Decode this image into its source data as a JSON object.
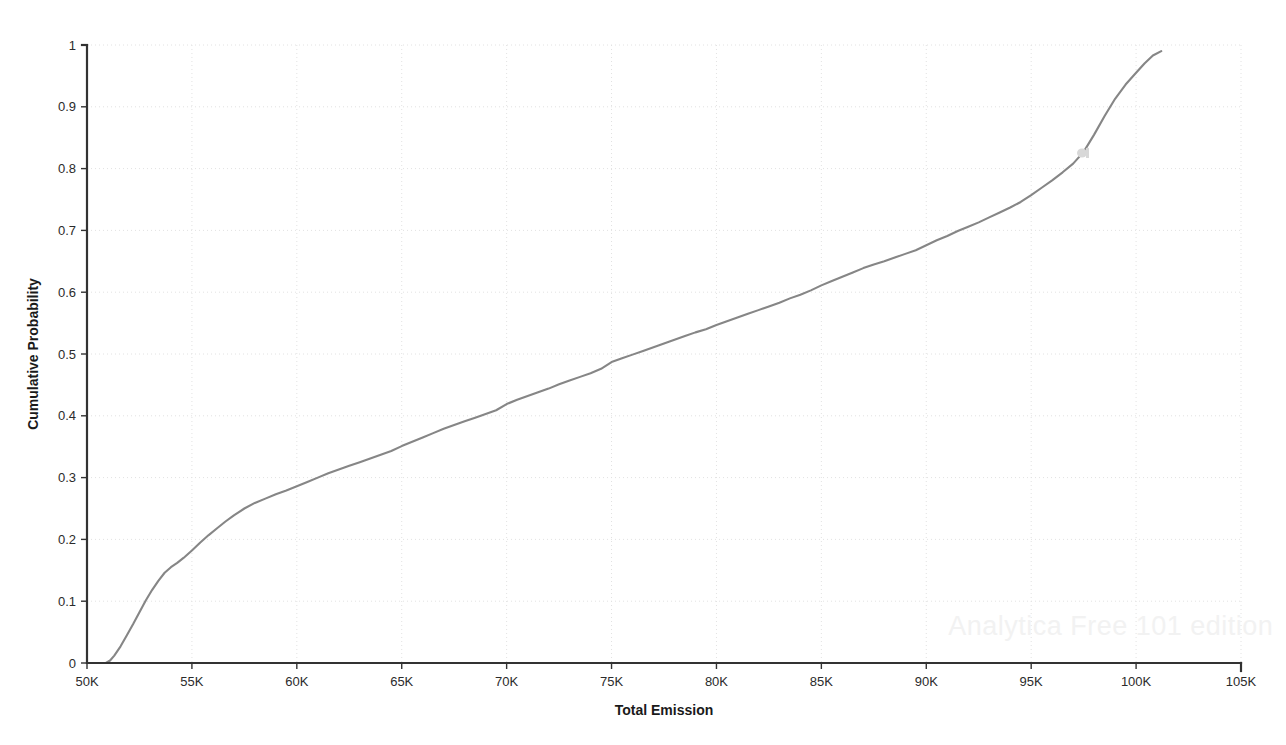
{
  "chart_data": {
    "type": "line",
    "title": "",
    "subtitle": "",
    "xlabel": "Total Emission",
    "ylabel": "Cumulative Probability",
    "xlim": [
      50000,
      105000
    ],
    "ylim": [
      0,
      1
    ],
    "grid": true,
    "legend": null,
    "legend_position": "none",
    "x_tick_labels": [
      "50K",
      "55K",
      "60K",
      "65K",
      "70K",
      "75K",
      "80K",
      "85K",
      "90K",
      "95K",
      "100K",
      "105K"
    ],
    "x_tick_values": [
      50000,
      55000,
      60000,
      65000,
      70000,
      75000,
      80000,
      85000,
      90000,
      95000,
      100000,
      105000
    ],
    "y_tick_labels": [
      "0",
      "0.1",
      "0.2",
      "0.3",
      "0.4",
      "0.5",
      "0.6",
      "0.7",
      "0.8",
      "0.9",
      "1"
    ],
    "y_tick_values": [
      0,
      0.1,
      0.2,
      0.3,
      0.4,
      0.5,
      0.6,
      0.7,
      0.8,
      0.9,
      1
    ],
    "series": [
      {
        "name": "Cumulative Probability",
        "color": "#868686",
        "x": [
          50000,
          50500,
          50900,
          51100,
          51300,
          51600,
          51900,
          52200,
          52500,
          52800,
          53100,
          53400,
          53700,
          54000,
          54300,
          54600,
          55000,
          55400,
          55800,
          56200,
          56600,
          57000,
          57500,
          58000,
          58500,
          59000,
          59500,
          60000,
          60500,
          61000,
          61500,
          62000,
          62500,
          63000,
          63500,
          64000,
          64500,
          65000,
          65500,
          66000,
          66500,
          67000,
          67500,
          68000,
          68500,
          69000,
          69500,
          70000,
          70500,
          71000,
          71500,
          72000,
          72500,
          73000,
          73500,
          74000,
          74500,
          75000,
          75500,
          76000,
          76500,
          77000,
          77500,
          78000,
          78500,
          79000,
          79500,
          80000,
          80500,
          81000,
          81500,
          82000,
          82500,
          83000,
          83500,
          84000,
          84500,
          85000,
          85500,
          86000,
          86500,
          87000,
          87500,
          88000,
          88500,
          89000,
          89500,
          90000,
          90500,
          91000,
          91500,
          92000,
          92500,
          93000,
          93500,
          94000,
          94500,
          95000,
          95500,
          96000,
          96500,
          97000,
          97500,
          98000,
          98500,
          99000,
          99500,
          100000,
          100400,
          100800,
          101200
        ],
        "y": [
          0,
          0,
          0,
          0.004,
          0.012,
          0.027,
          0.045,
          0.063,
          0.082,
          0.101,
          0.118,
          0.133,
          0.146,
          0.155,
          0.162,
          0.17,
          0.182,
          0.195,
          0.207,
          0.218,
          0.229,
          0.239,
          0.25,
          0.259,
          0.266,
          0.273,
          0.279,
          0.286,
          0.293,
          0.3,
          0.307,
          0.313,
          0.319,
          0.325,
          0.331,
          0.337,
          0.343,
          0.351,
          0.358,
          0.365,
          0.372,
          0.379,
          0.385,
          0.391,
          0.397,
          0.403,
          0.409,
          0.419,
          0.426,
          0.432,
          0.438,
          0.444,
          0.451,
          0.457,
          0.463,
          0.469,
          0.476,
          0.487,
          0.493,
          0.499,
          0.505,
          0.511,
          0.517,
          0.523,
          0.529,
          0.535,
          0.54,
          0.547,
          0.553,
          0.559,
          0.565,
          0.571,
          0.577,
          0.583,
          0.59,
          0.596,
          0.603,
          0.611,
          0.618,
          0.625,
          0.632,
          0.639,
          0.645,
          0.65,
          0.656,
          0.662,
          0.668,
          0.676,
          0.684,
          0.691,
          0.699,
          0.706,
          0.713,
          0.721,
          0.729,
          0.737,
          0.746,
          0.757,
          0.769,
          0.781,
          0.794,
          0.808,
          0.827,
          0.855,
          0.885,
          0.913,
          0.936,
          0.955,
          0.97,
          0.983,
          0.99
        ]
      }
    ],
    "annotations": [
      {
        "name": "watermark",
        "text": "Analytica Free 101 edition",
        "x": 97000,
        "y": 0.045
      }
    ]
  },
  "axes": {
    "x_title": "Total Emission",
    "y_title": "Cumulative Probability"
  },
  "watermark": {
    "text": "Analytica Free 101 edition"
  },
  "colors": {
    "curve": "#868686",
    "axis": "#333333",
    "grid": "#e2e2e2",
    "text": "#1a1a1a",
    "watermark": "#f2f2f2",
    "background": "#ffffff"
  }
}
